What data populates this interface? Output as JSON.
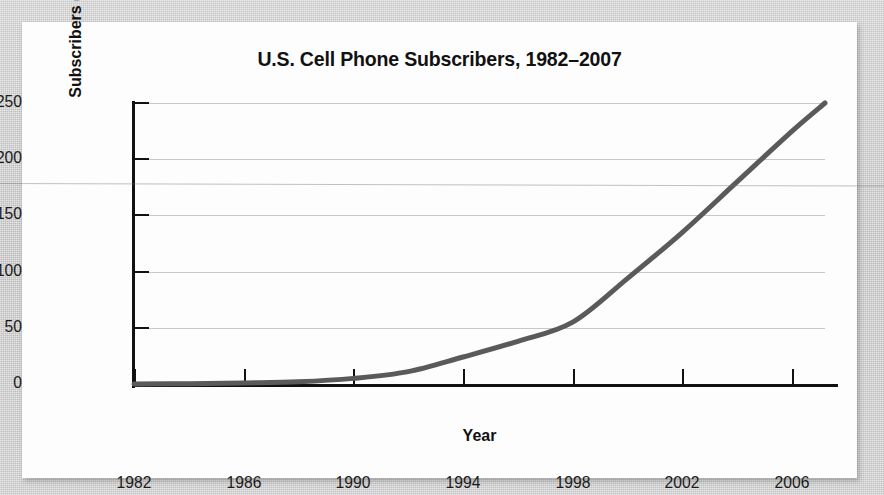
{
  "figure": {
    "title": "U.S. Cell Phone Subscribers, 1982–2007",
    "card_background": "#fdfdfd",
    "page_background": "#c9c9c9"
  },
  "chart_data": {
    "type": "line",
    "title": "U.S. Cell Phone Subscribers, 1982–2007",
    "xlabel": "Year",
    "ylabel": "Subscribers (in millions)",
    "xlim": [
      1982,
      2007.2
    ],
    "ylim": [
      0,
      250
    ],
    "xticks": [
      1982,
      1986,
      1990,
      1994,
      1998,
      2002,
      2006
    ],
    "xtick_labels": [
      "1982",
      "1986",
      "1990",
      "1994",
      "1998",
      "2002",
      "2006"
    ],
    "yticks": [
      0,
      50,
      100,
      150,
      200,
      250
    ],
    "ytick_labels": [
      "0",
      "50",
      "100",
      "150",
      "200",
      "250"
    ],
    "grid": "horizontal",
    "legend": "none",
    "line_color": "#5a5a5a",
    "line_width": 5,
    "series": [
      {
        "name": "U.S. cell phone subscribers",
        "x": [
          1982,
          1984,
          1986,
          1988,
          1990,
          1992,
          1994,
          1996,
          1998,
          2000,
          2002,
          2004,
          2006,
          2007.2
        ],
        "values": [
          0,
          0.3,
          1,
          2,
          5,
          11,
          24,
          38,
          55,
          94,
          135,
          180,
          225,
          250
        ]
      }
    ],
    "annotations": [
      "curve crosses 50 million near 1998",
      "curve crosses 100 million near 2000.5",
      "curve crosses 150 million near 2003",
      "curve ends near 250 million at 2007"
    ]
  }
}
